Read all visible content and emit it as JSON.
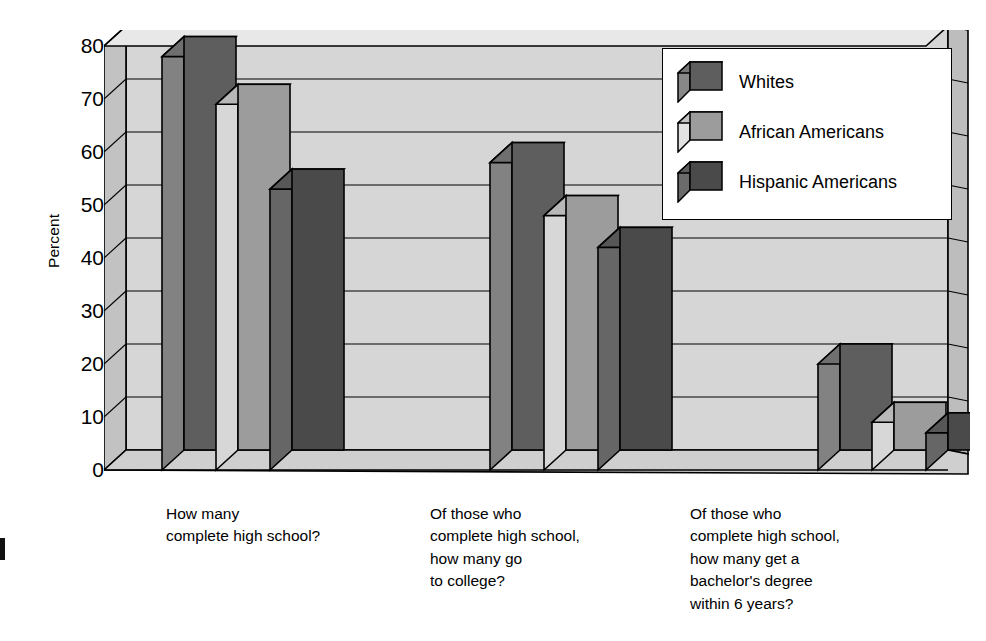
{
  "chart_data": {
    "type": "bar",
    "title": "",
    "subtitle": "",
    "xlabel": "",
    "ylabel": "Percent",
    "ylim": [
      0,
      80
    ],
    "ytick_values": [
      80,
      70,
      60,
      50,
      40,
      30,
      20,
      10,
      0
    ],
    "ytick_labels": [
      "80",
      "70",
      "60",
      "50",
      "40",
      "30",
      "20",
      "10",
      "0"
    ],
    "grid": true,
    "grid_orientation": "horizontal",
    "legend_position": "top-right",
    "style": "3d-bar",
    "categories": [
      "How many\ncomplete high school?",
      "Of those who\ncomplete high school,\nhow many go\nto college?",
      "Of those who\ncomplete high school,\nhow many get a\nbachelor's degree\nwithin 6 years?"
    ],
    "series": [
      {
        "name": "Whites",
        "color": "#5e5e5e",
        "values": [
          78,
          58,
          20
        ]
      },
      {
        "name": "African Americans",
        "color": "#9c9c9c",
        "values": [
          69,
          48,
          9
        ]
      },
      {
        "name": "Hispanic Americans",
        "color": "#4a4a4a",
        "values": [
          53,
          42,
          7
        ]
      }
    ],
    "annotations": []
  },
  "axis": {
    "y_title": "Percent"
  },
  "legend": {
    "entries": [
      {
        "label": "Whites",
        "swatch": "legend-cube-whites"
      },
      {
        "label": "African Americans",
        "swatch": "legend-cube-african-americans"
      },
      {
        "label": "Hispanic Americans",
        "swatch": "legend-cube-hispanic-americans"
      }
    ]
  },
  "colors": {
    "series_whites": "#5e5e5e",
    "series_african_americans": "#9c9c9c",
    "series_hispanic_americans": "#4a4a4a",
    "plot_wall": "#d6d6d6",
    "plot_wall_shadow": "#c2c2c2",
    "floor": "#cfcfcf",
    "outline": "#000000",
    "background": "#ffffff",
    "legend_background": "#ffffff"
  },
  "category_captions": {
    "c0": "How many\ncomplete high school?",
    "c1": "Of those who\ncomplete high school,\nhow many go\nto college?",
    "c2": "Of those who\ncomplete high school,\nhow many get a\nbachelor's degree\nwithin 6 years?"
  }
}
